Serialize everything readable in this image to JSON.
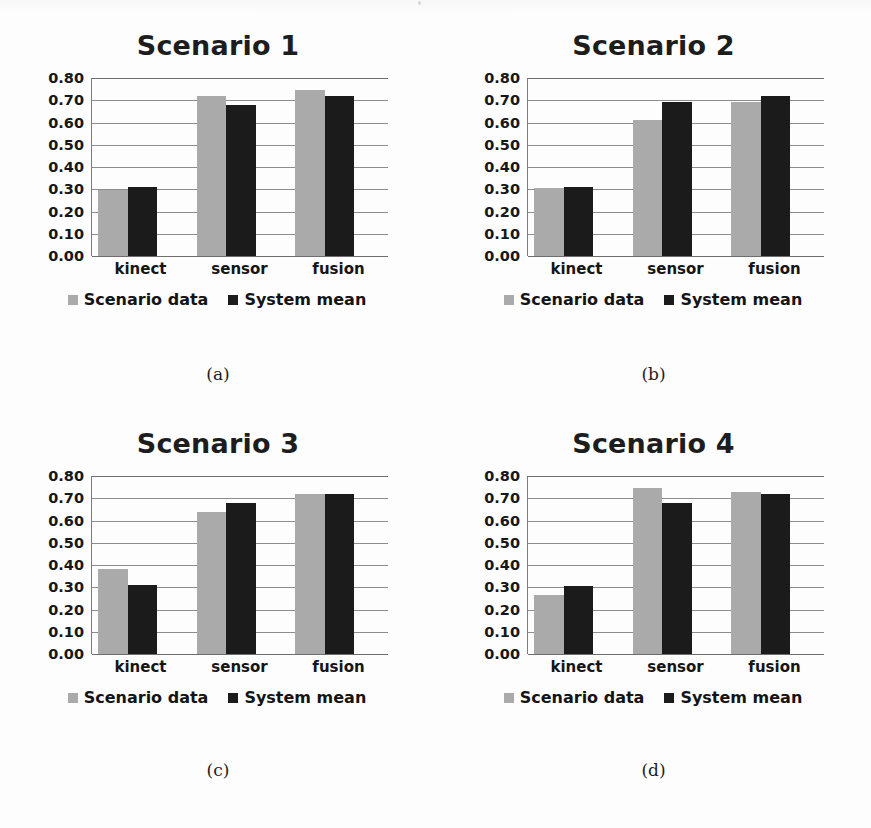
{
  "figure": {
    "background": "#fdfdfd",
    "series_colors": {
      "scenario_data": "#aaaaaa",
      "system_mean": "#1b1b1b"
    },
    "legend": {
      "scenario_data": "Scenario data",
      "system_mean": "System mean"
    },
    "y_ticks": [
      "0.80",
      "0.70",
      "0.60",
      "0.50",
      "0.40",
      "0.30",
      "0.20",
      "0.10",
      "0.00"
    ],
    "categories": [
      "kinect",
      "sensor",
      "fusion"
    ],
    "captions": [
      "(a)",
      "(b)",
      "(c)",
      "(d)"
    ]
  },
  "panels": [
    {
      "title": "Scenario 1",
      "caption": "(a)",
      "legend": {
        "scenario_data": "Scenario data",
        "system_mean": "System mean"
      },
      "y_ticks": [
        "0.80",
        "0.70",
        "0.60",
        "0.50",
        "0.40",
        "0.30",
        "0.20",
        "0.10",
        "0.00"
      ],
      "categories": [
        "kinect",
        "sensor",
        "fusion"
      ]
    },
    {
      "title": "Scenario 2",
      "caption": "(b)",
      "legend": {
        "scenario_data": "Scenario data",
        "system_mean": "System mean"
      },
      "y_ticks": [
        "0.80",
        "0.70",
        "0.60",
        "0.50",
        "0.40",
        "0.30",
        "0.20",
        "0.10",
        "0.00"
      ],
      "categories": [
        "kinect",
        "sensor",
        "fusion"
      ]
    },
    {
      "title": "Scenario 3",
      "caption": "(c)",
      "legend": {
        "scenario_data": "Scenario data",
        "system_mean": "System mean"
      },
      "y_ticks": [
        "0.80",
        "0.70",
        "0.60",
        "0.50",
        "0.40",
        "0.30",
        "0.20",
        "0.10",
        "0.00"
      ],
      "categories": [
        "kinect",
        "sensor",
        "fusion"
      ]
    },
    {
      "title": "Scenario 4",
      "caption": "(d)",
      "legend": {
        "scenario_data": "Scenario data",
        "system_mean": "System mean"
      },
      "y_ticks": [
        "0.80",
        "0.70",
        "0.60",
        "0.50",
        "0.40",
        "0.30",
        "0.20",
        "0.10",
        "0.00"
      ],
      "categories": [
        "kinect",
        "sensor",
        "fusion"
      ]
    }
  ],
  "chart_data": [
    {
      "type": "bar",
      "title": "Scenario 1",
      "caption": "(a)",
      "xlabel": "",
      "ylabel": "",
      "ylim": [
        0.0,
        0.8
      ],
      "ytick_step": 0.1,
      "grid": true,
      "legend_position": "bottom",
      "categories": [
        "kinect",
        "sensor",
        "fusion"
      ],
      "series": [
        {
          "name": "Scenario data",
          "color": "#aaaaaa",
          "values": [
            0.295,
            0.72,
            0.745
          ]
        },
        {
          "name": "System mean",
          "color": "#1b1b1b",
          "values": [
            0.31,
            0.68,
            0.72
          ]
        }
      ]
    },
    {
      "type": "bar",
      "title": "Scenario 2",
      "caption": "(b)",
      "xlabel": "",
      "ylabel": "",
      "ylim": [
        0.0,
        0.8
      ],
      "ytick_step": 0.1,
      "grid": true,
      "legend_position": "bottom",
      "categories": [
        "kinect",
        "sensor",
        "fusion"
      ],
      "series": [
        {
          "name": "Scenario data",
          "color": "#aaaaaa",
          "values": [
            0.305,
            0.61,
            0.69
          ]
        },
        {
          "name": "System mean",
          "color": "#1b1b1b",
          "values": [
            0.31,
            0.69,
            0.72
          ]
        }
      ]
    },
    {
      "type": "bar",
      "title": "Scenario 3",
      "caption": "(c)",
      "xlabel": "",
      "ylabel": "",
      "ylim": [
        0.0,
        0.8
      ],
      "ytick_step": 0.1,
      "grid": true,
      "legend_position": "bottom",
      "categories": [
        "kinect",
        "sensor",
        "fusion"
      ],
      "series": [
        {
          "name": "Scenario data",
          "color": "#aaaaaa",
          "values": [
            0.38,
            0.64,
            0.72
          ]
        },
        {
          "name": "System mean",
          "color": "#1b1b1b",
          "values": [
            0.31,
            0.68,
            0.72
          ]
        }
      ]
    },
    {
      "type": "bar",
      "title": "Scenario 4",
      "caption": "(d)",
      "xlabel": "",
      "ylabel": "",
      "ylim": [
        0.0,
        0.8
      ],
      "ytick_step": 0.1,
      "grid": true,
      "legend_position": "bottom",
      "categories": [
        "kinect",
        "sensor",
        "fusion"
      ],
      "series": [
        {
          "name": "Scenario data",
          "color": "#aaaaaa",
          "values": [
            0.265,
            0.745,
            0.73
          ]
        },
        {
          "name": "System mean",
          "color": "#1b1b1b",
          "values": [
            0.305,
            0.68,
            0.72
          ]
        }
      ]
    }
  ]
}
